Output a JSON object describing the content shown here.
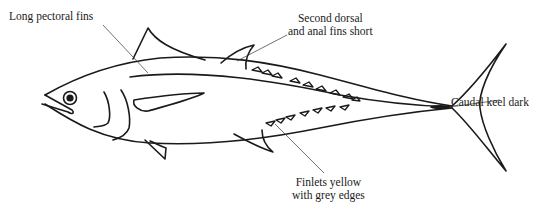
{
  "diagram": {
    "line_color": "#1a1a1a",
    "background": "#ffffff",
    "labels": [
      {
        "id": "pectoral",
        "lines": [
          "Long pectoral fins"
        ]
      },
      {
        "id": "dorsal",
        "lines": [
          "Second dorsal",
          "and anal fins short"
        ]
      },
      {
        "id": "caudal",
        "lines": [
          "Caudal keel dark"
        ]
      },
      {
        "id": "finlets",
        "lines": [
          "Finlets yellow",
          "with grey edges"
        ]
      }
    ]
  }
}
